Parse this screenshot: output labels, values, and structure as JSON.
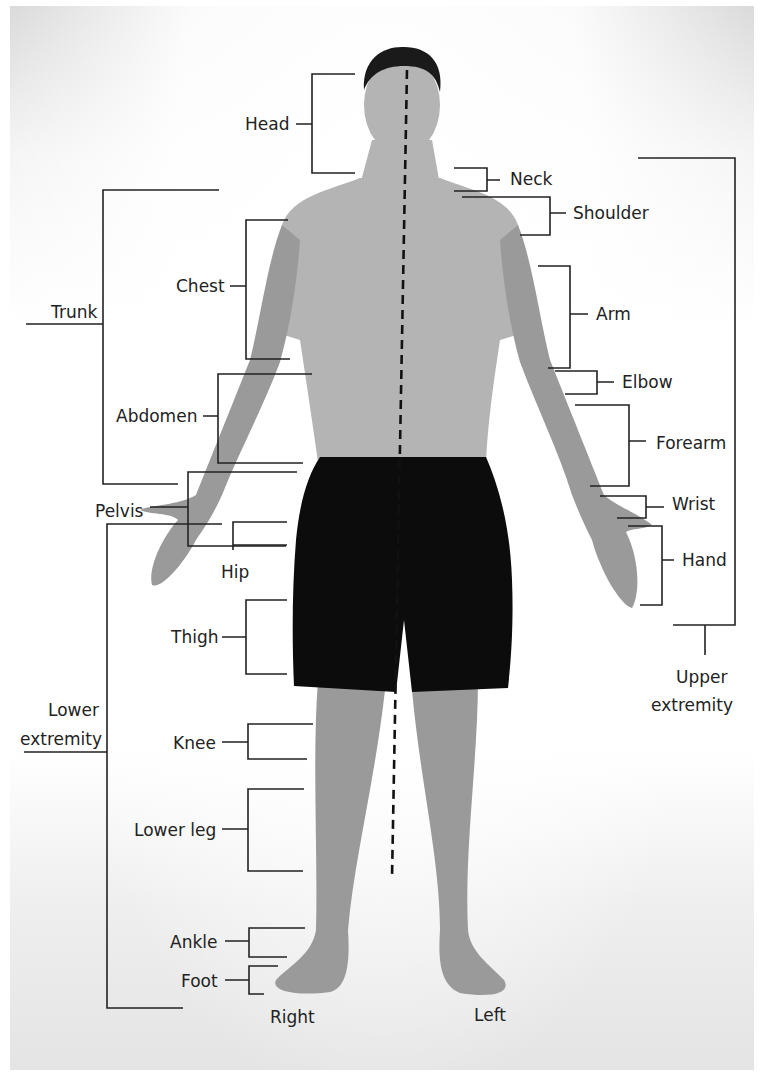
{
  "diagram": {
    "midline": {
      "x1": 407,
      "y1": 70,
      "x2": 392,
      "y2": 878,
      "style": "dashed"
    },
    "side_labels": [
      {
        "id": "right",
        "text": "Right",
        "x": 270,
        "y": 1023
      },
      {
        "id": "left",
        "text": "Left",
        "x": 474,
        "y": 1021
      }
    ],
    "labels": [
      {
        "id": "head",
        "text": "Head",
        "x": 245,
        "y": 130,
        "anchor": "start"
      },
      {
        "id": "neck",
        "text": "Neck",
        "x": 510,
        "y": 185,
        "anchor": "start"
      },
      {
        "id": "shoulder",
        "text": "Shoulder",
        "x": 573,
        "y": 219,
        "anchor": "start"
      },
      {
        "id": "trunk",
        "text": "Trunk",
        "x": 51,
        "y": 318,
        "anchor": "start"
      },
      {
        "id": "chest",
        "text": "Chest",
        "x": 176,
        "y": 292,
        "anchor": "start"
      },
      {
        "id": "arm",
        "text": "Arm",
        "x": 596,
        "y": 320,
        "anchor": "start"
      },
      {
        "id": "elbow",
        "text": "Elbow",
        "x": 622,
        "y": 388,
        "anchor": "start"
      },
      {
        "id": "abdomen",
        "text": "Abdomen",
        "x": 116,
        "y": 422,
        "anchor": "start"
      },
      {
        "id": "forearm",
        "text": "Forearm",
        "x": 656,
        "y": 449,
        "anchor": "start"
      },
      {
        "id": "pelvis",
        "text": "Pelvis",
        "x": 95,
        "y": 517,
        "anchor": "start"
      },
      {
        "id": "wrist",
        "text": "Wrist",
        "x": 672,
        "y": 510,
        "anchor": "start"
      },
      {
        "id": "hand",
        "text": "Hand",
        "x": 682,
        "y": 566,
        "anchor": "start"
      },
      {
        "id": "hip",
        "text": "Hip",
        "x": 221,
        "y": 578,
        "anchor": "start"
      },
      {
        "id": "thigh",
        "text": "Thigh",
        "x": 171,
        "y": 643,
        "anchor": "start"
      },
      {
        "id": "upper-extremity-1",
        "text": "Upper",
        "x": 676,
        "y": 683,
        "anchor": "start"
      },
      {
        "id": "upper-extremity-2",
        "text": "extremity",
        "x": 651,
        "y": 711,
        "anchor": "start"
      },
      {
        "id": "lower-extremity-1",
        "text": "Lower",
        "x": 48,
        "y": 716,
        "anchor": "start"
      },
      {
        "id": "lower-extremity-2",
        "text": "extremity",
        "x": 20,
        "y": 745,
        "anchor": "start"
      },
      {
        "id": "knee",
        "text": "Knee",
        "x": 173,
        "y": 749,
        "anchor": "start"
      },
      {
        "id": "lower-leg",
        "text": "Lower leg",
        "x": 134,
        "y": 836,
        "anchor": "start"
      },
      {
        "id": "ankle",
        "text": "Ankle",
        "x": 170,
        "y": 948,
        "anchor": "start"
      },
      {
        "id": "foot",
        "text": "Foot",
        "x": 181,
        "y": 987,
        "anchor": "start"
      }
    ],
    "brackets": [
      {
        "id": "head-bracket",
        "d": "M355 74 H312 V173 H355 M296 124 H312"
      },
      {
        "id": "neck-bracket",
        "d": "M454 168 H487 V191 H454 M487 180 H500"
      },
      {
        "id": "shoulder-bracket",
        "d": "M462 197 H550 V235 H520 M550 213 H566"
      },
      {
        "id": "trunk-bracket",
        "d": "M219 190 H103 V484 H178 M26 324 H103"
      },
      {
        "id": "chest-bracket",
        "d": "M288 220 H246 V359 H290 M230 286 H246"
      },
      {
        "id": "arm-bracket",
        "d": "M538 266 H570 V368 H548 M570 314 H588"
      },
      {
        "id": "elbow-bracket",
        "d": "M555 371 H597 V394 H565 M597 382 H614"
      },
      {
        "id": "abdomen-bracket",
        "d": "M312 374 H218 V463 H303 M203 416 H218"
      },
      {
        "id": "forearm-bracket",
        "d": "M575 405 H629 V486 H590 M629 441 H646"
      },
      {
        "id": "upper-extremity-bracket",
        "d": "M638 158 H735 V625 H673 M705 625 V655"
      },
      {
        "id": "pelvis-bracket",
        "d": "M297 472 H188 V546 H286 M150 507 H188"
      },
      {
        "id": "wrist-bracket",
        "d": "M600 496 H646 V518 H617 M646 507 H664"
      },
      {
        "id": "hand-bracket",
        "d": "M628 526 H662 V605 H640 M662 560 H674"
      },
      {
        "id": "hip-bracket",
        "d": "M287 522 H233 V550 M233 545 H287"
      },
      {
        "id": "lower-extremity-bracket",
        "d": "M222 524 H107 V1008 H183 M24 752 H107"
      },
      {
        "id": "thigh-bracket",
        "d": "M287 600 H246 V674 H287 M222 637 H246"
      },
      {
        "id": "knee-bracket",
        "d": "M313 724 H248 V759 H307 M222 742 H248"
      },
      {
        "id": "lower-leg-bracket",
        "d": "M304 789 H248 V871 H303 M222 829 H248"
      },
      {
        "id": "ankle-bracket",
        "d": "M305 928 H249 V957 H287 M225 941 H249"
      },
      {
        "id": "foot-bracket",
        "d": "M278 966 H249 V994 H264 M225 980 H249"
      }
    ]
  }
}
